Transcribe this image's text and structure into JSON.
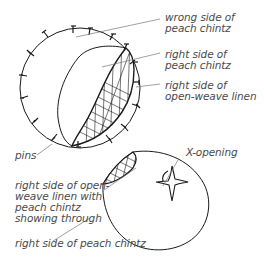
{
  "labels": {
    "wrong_side": "wrong side of\npeach chintz",
    "right_side_chintz": "right side of\npeach chintz",
    "right_side_linen": "right side of\nopen-weave linen",
    "pins": "pins",
    "x_opening": "X-opening",
    "linen_through": "right side of open-\nweave linen with\npeach chintz\nshowing through",
    "right_side_peach": "right side of peach chintz"
  },
  "colors": {
    "ink": "#1a1a1a",
    "leader": "#777777",
    "text": "#4a4a4a"
  }
}
